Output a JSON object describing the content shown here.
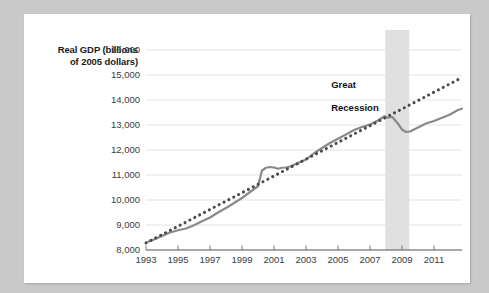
{
  "figure": {
    "background_color": "#c9c9c9",
    "card_color": "#ffffff"
  },
  "chart_data": {
    "type": "line",
    "title": "",
    "subtitle": "",
    "ylabel": "Real GDP (billions\nof 2005 dollars)",
    "xlabel": "",
    "ylim": [
      8000,
      16000
    ],
    "xlim": [
      1993,
      2012.75
    ],
    "grid": true,
    "grid_color": "#e3e3e3",
    "legend": "none",
    "yticks": [
      8000,
      9000,
      10000,
      11000,
      12000,
      13000,
      14000,
      15000,
      16000
    ],
    "ytick_labels": [
      "8,000",
      "9,000",
      "10,000",
      "11,000",
      "12,000",
      "13,000",
      "14,000",
      "15,000",
      "16,000"
    ],
    "xticks": [
      1993,
      1995,
      1997,
      1999,
      2001,
      2003,
      2005,
      2007,
      2009,
      2011
    ],
    "xtick_labels": [
      "1993",
      "1995",
      "1997",
      "1999",
      "2001",
      "2003",
      "2005",
      "2007",
      "2009",
      "2011"
    ],
    "annotations": [
      {
        "text": "Great\nRecession",
        "x": 2007.2,
        "y": 15050,
        "color": "#111111"
      }
    ],
    "shaded_regions": [
      {
        "name": "Great Recession",
        "x_start": 2007.95,
        "x_end": 2009.45,
        "color": "#e0e0e0"
      }
    ],
    "series": [
      {
        "name": "Real GDP",
        "style": "solid",
        "color": "#8a8a8a",
        "width": 2.2,
        "x": [
          1993.0,
          1993.5,
          1994.0,
          1994.5,
          1995.0,
          1995.5,
          1996.0,
          1996.5,
          1997.0,
          1997.5,
          1998.0,
          1998.5,
          1999.0,
          1999.5,
          2000.0,
          2000.25,
          2000.5,
          2000.75,
          2001.0,
          2001.25,
          2001.5,
          2001.75,
          2002.0,
          2002.5,
          2003.0,
          2003.5,
          2004.0,
          2004.5,
          2005.0,
          2005.5,
          2006.0,
          2006.5,
          2007.0,
          2007.5,
          2007.9,
          2008.1,
          2008.4,
          2008.75,
          2009.0,
          2009.25,
          2009.5,
          2010.0,
          2010.5,
          2011.0,
          2011.5,
          2012.0,
          2012.5,
          2012.75
        ],
        "y": [
          8300,
          8420,
          8560,
          8700,
          8790,
          8860,
          8990,
          9150,
          9300,
          9500,
          9680,
          9880,
          10080,
          10320,
          10550,
          11180,
          11290,
          11320,
          11300,
          11250,
          11290,
          11300,
          11340,
          11480,
          11620,
          11870,
          12080,
          12280,
          12450,
          12620,
          12800,
          12920,
          13020,
          13180,
          13350,
          13290,
          13320,
          13050,
          12820,
          12720,
          12740,
          12900,
          13060,
          13160,
          13290,
          13420,
          13600,
          13650
        ]
      },
      {
        "name": "Trend (potential output)",
        "style": "dotted",
        "color": "#4a4a4a",
        "width": 3.0,
        "x": [
          1993.0,
          2012.75
        ],
        "y": [
          8280,
          14900
        ]
      }
    ]
  },
  "yaxis": {
    "ticks": [
      {
        "value": 16000,
        "label": "16,000"
      },
      {
        "value": 15000,
        "label": "15,000"
      },
      {
        "value": 14000,
        "label": "14,000"
      },
      {
        "value": 13000,
        "label": "13,000"
      },
      {
        "value": 12000,
        "label": "12,000"
      },
      {
        "value": 11000,
        "label": "11,000"
      },
      {
        "value": 10000,
        "label": "10,000"
      },
      {
        "value": 9000,
        "label": "9,000"
      },
      {
        "value": 8000,
        "label": "8,000"
      }
    ]
  },
  "xaxis": {
    "ticks": [
      {
        "value": 1993,
        "label": "1993"
      },
      {
        "value": 1995,
        "label": "1995"
      },
      {
        "value": 1997,
        "label": "1997"
      },
      {
        "value": 1999,
        "label": "1999"
      },
      {
        "value": 2001,
        "label": "2001"
      },
      {
        "value": 2003,
        "label": "2003"
      },
      {
        "value": 2005,
        "label": "2005"
      },
      {
        "value": 2007,
        "label": "2007"
      },
      {
        "value": 2009,
        "label": "2009"
      },
      {
        "value": 2011,
        "label": "2011"
      }
    ]
  },
  "labels": {
    "axis_title_line1": "Real GDP (billions",
    "axis_title_line2": "of 2005 dollars)",
    "recession_line1": "Great",
    "recession_line2": "Recession"
  }
}
